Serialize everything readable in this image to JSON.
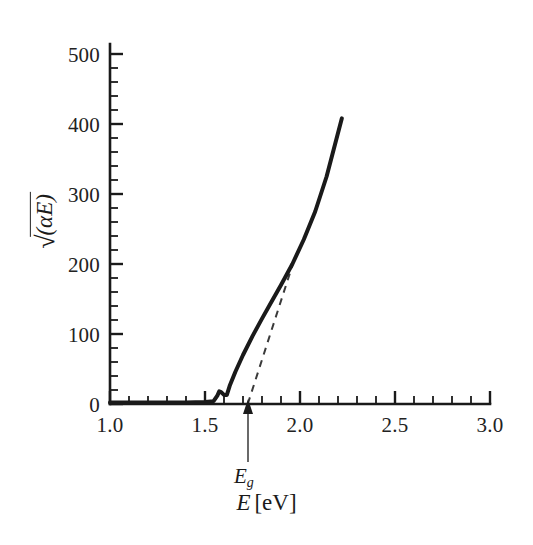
{
  "figure": {
    "background_color": "#ffffff",
    "ink_color": "#1a1a1a"
  },
  "axes": {
    "x": {
      "title_var": "E",
      "title_unit": "[eV]",
      "title_full": "E [eV]",
      "tick_labels": [
        "1.0",
        "1.5",
        "2.0",
        "2.5",
        "3.0"
      ],
      "tick_values": [
        1.0,
        1.5,
        2.0,
        2.5,
        3.0
      ],
      "minor_ticks_per_interval": 5,
      "range": [
        1.0,
        3.0
      ]
    },
    "y": {
      "title_full": "√(αE)",
      "title_radicand": "(αE)",
      "tick_labels": [
        "0",
        "100",
        "200",
        "300",
        "400",
        "500"
      ],
      "tick_values": [
        0,
        100,
        200,
        300,
        400,
        500
      ],
      "minor_ticks_per_interval": 5,
      "range": [
        0,
        500
      ]
    }
  },
  "annotations": {
    "band_gap": {
      "label": "E",
      "subscript": "g",
      "label_full": "Eg",
      "x_value": 1.725,
      "arrow": "up-arrow"
    }
  },
  "chart_data": {
    "type": "line",
    "title": "",
    "xlabel": "E [eV]",
    "ylabel": "√(αE)",
    "xlim": [
      1.0,
      3.0
    ],
    "ylim": [
      0,
      500
    ],
    "grid": false,
    "legend": null,
    "series": [
      {
        "name": "absorption-curve",
        "style": "solid",
        "line_width": 4,
        "color": "#1a1a1a",
        "x": [
          1.0,
          1.2,
          1.4,
          1.5,
          1.545,
          1.565,
          1.575,
          1.585,
          1.6,
          1.615,
          1.63,
          1.66,
          1.7,
          1.75,
          1.8,
          1.85,
          1.9,
          1.96,
          2.02,
          2.08,
          2.14,
          2.22
        ],
        "y": [
          2,
          2,
          2,
          3,
          4,
          12,
          18,
          17,
          13,
          13,
          26,
          46,
          70,
          97,
          122,
          146,
          170,
          200,
          235,
          275,
          325,
          408
        ]
      },
      {
        "name": "linear-extrapolation",
        "style": "dashed",
        "line_width": 2,
        "color": "#3a3a3a",
        "x": [
          1.725,
          1.96
        ],
        "y": [
          0,
          198
        ]
      }
    ]
  }
}
